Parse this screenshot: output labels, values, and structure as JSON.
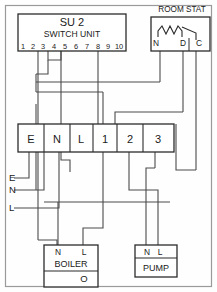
{
  "diagram": {
    "frame_color": "#9a9a9a",
    "wire_color": "#4a4a4a",
    "box_stroke": "#2b2b2b",
    "text_color": "#1a1a1a",
    "background": "#fefefe"
  },
  "switch_unit": {
    "title": "SU 2",
    "subtitle": "SWITCH UNIT",
    "terminals": [
      "1",
      "2",
      "3",
      "4",
      "5",
      "6",
      "7",
      "8",
      "9",
      "10"
    ],
    "connected_terminals": [
      "3",
      "4",
      "5",
      "8"
    ],
    "link_note": "4-5 linked"
  },
  "room_stat": {
    "label": "ROOM STAT",
    "terminals": [
      "N",
      "D",
      "C"
    ],
    "symbol": "resistor-and-switch"
  },
  "terminal_block": {
    "terminals": [
      "E",
      "N",
      "L",
      "1",
      "2",
      "3"
    ]
  },
  "supply": {
    "labels": [
      "E",
      "N",
      "L"
    ]
  },
  "boiler": {
    "terminals": [
      "N",
      "L"
    ],
    "label": "BOILER",
    "indicator": "O"
  },
  "pump": {
    "terminals": [
      "N",
      "L"
    ],
    "label": "PUMP"
  }
}
